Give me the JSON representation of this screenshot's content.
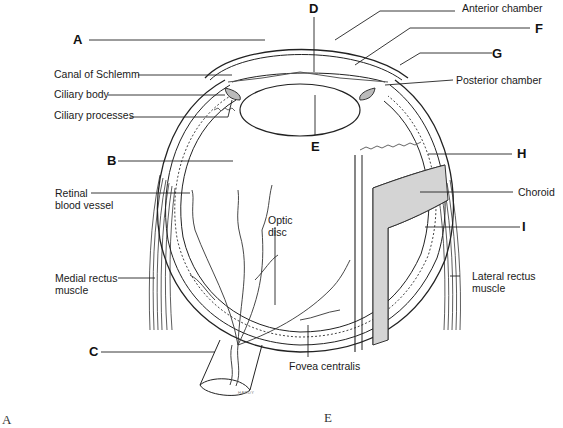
{
  "diagram": {
    "letter_labels": {
      "A": "A",
      "B": "B",
      "C": "C",
      "D": "D",
      "E": "E",
      "F": "F",
      "G": "G",
      "H": "H",
      "I": "I"
    },
    "named_labels": {
      "anterior_chamber": "Anterior chamber",
      "canal_of_schlemm": "Canal of Schlemm",
      "ciliary_body": "Ciliary body",
      "posterior_chamber": "Posterior chamber",
      "ciliary_processes": "Ciliary processes",
      "retinal_blood_vessel": "Retinal\nblood vessel",
      "choroid": "Choroid",
      "optic_disc": "Optic\ndisc",
      "medial_rectus_muscle": "Medial rectus\nmuscle",
      "lateral_rectus_muscle": "Lateral rectus\nmuscle",
      "fovea_centralis": "Fovea centralis"
    },
    "artist_signature": "HARDY",
    "cut_off_bottom_letters": [
      "A",
      "E"
    ]
  }
}
